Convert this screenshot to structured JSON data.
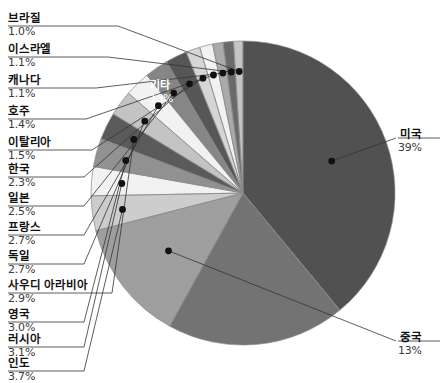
{
  "chart_data": {
    "type": "pie",
    "title": "",
    "legend": "callout-labels",
    "grid": false,
    "units": "percent",
    "total_label": "100%",
    "categories": [
      "미국",
      "기타",
      "중국",
      "인도",
      "러시아",
      "영국",
      "사우디 아라비아",
      "독일",
      "프랑스",
      "일본",
      "한국",
      "이탈리아",
      "호주",
      "캐나다",
      "이스라엘",
      "브라질"
    ],
    "values": [
      39,
      19,
      13,
      3.7,
      3.1,
      3.0,
      2.9,
      2.7,
      2.7,
      2.5,
      2.3,
      1.5,
      1.4,
      1.1,
      1.1,
      1.0
    ],
    "value_labels": [
      "39%",
      "19%",
      "13%",
      "3.7%",
      "3.1%",
      "3.0%",
      "2.9%",
      "2.7%",
      "2.7%",
      "2.5%",
      "2.3%",
      "1.5%",
      "1.4%",
      "1.1%",
      "1.1%",
      "1.0%"
    ],
    "slice_colors": [
      "#565656",
      "#7a7a7a",
      "#a8a8a8",
      "#d8d8d8",
      "#ffffff",
      "#9a9a9a",
      "#606060",
      "#cfcfcf",
      "#ffffff",
      "#8e8e8e",
      "#5c5c5c",
      "#e2e2e2",
      "#ffffff",
      "#b4b4b4",
      "#707070",
      "#d0d0d0"
    ],
    "slices": [
      {
        "name": "미국",
        "value": 39,
        "value_label": "39%",
        "color": "#565656",
        "label_position": "right-outside"
      },
      {
        "name": "기타",
        "value": 19,
        "value_label": "19%",
        "color": "#7a7a7a",
        "label_position": "inside"
      },
      {
        "name": "중국",
        "value": 13,
        "value_label": "13%",
        "color": "#a8a8a8",
        "label_position": "right-outside"
      },
      {
        "name": "인도",
        "value": 3.7,
        "value_label": "3.7%",
        "color": "#d8d8d8",
        "label_position": "left-outside"
      },
      {
        "name": "러시아",
        "value": 3.1,
        "value_label": "3.1%",
        "color": "#ffffff",
        "label_position": "left-outside"
      },
      {
        "name": "영국",
        "value": 3.0,
        "value_label": "3.0%",
        "color": "#9a9a9a",
        "label_position": "left-outside"
      },
      {
        "name": "사우디 아라비아",
        "value": 2.9,
        "value_label": "2.9%",
        "color": "#606060",
        "label_position": "left-outside"
      },
      {
        "name": "독일",
        "value": 2.7,
        "value_label": "2.7%",
        "color": "#cfcfcf",
        "label_position": "left-outside"
      },
      {
        "name": "프랑스",
        "value": 2.7,
        "value_label": "2.7%",
        "color": "#ffffff",
        "label_position": "left-outside"
      },
      {
        "name": "일본",
        "value": 2.5,
        "value_label": "2.5%",
        "color": "#8e8e8e",
        "label_position": "left-outside"
      },
      {
        "name": "한국",
        "value": 2.3,
        "value_label": "2.3%",
        "color": "#5c5c5c",
        "label_position": "left-outside"
      },
      {
        "name": "이탈리아",
        "value": 1.5,
        "value_label": "1.5%",
        "color": "#e2e2e2",
        "label_position": "left-outside"
      },
      {
        "name": "호주",
        "value": 1.4,
        "value_label": "1.4%",
        "color": "#ffffff",
        "label_position": "left-outside"
      },
      {
        "name": "캐나다",
        "value": 1.1,
        "value_label": "1.1%",
        "color": "#b4b4b4",
        "label_position": "left-outside"
      },
      {
        "name": "이스라엘",
        "value": 1.1,
        "value_label": "1.1%",
        "color": "#707070",
        "label_position": "left-outside"
      },
      {
        "name": "브라질",
        "value": 1.0,
        "value_label": "1.0%",
        "color": "#d0d0d0",
        "label_position": "left-outside"
      }
    ]
  },
  "labels": {
    "brazil": {
      "name": "브라질",
      "value": "1.0%"
    },
    "israel": {
      "name": "이스라엘",
      "value": "1.1%"
    },
    "canada": {
      "name": "캐나다",
      "value": "1.1%"
    },
    "australia": {
      "name": "호주",
      "value": "1.4%"
    },
    "italy": {
      "name": "이탈리아",
      "value": "1.5%"
    },
    "korea": {
      "name": "한국",
      "value": "2.3%"
    },
    "japan": {
      "name": "일본",
      "value": "2.5%"
    },
    "france": {
      "name": "프랑스",
      "value": "2.7%"
    },
    "germany": {
      "name": "독일",
      "value": "2.7%"
    },
    "saudi_arabia": {
      "name": "사우디 아라비아",
      "value": "2.9%"
    },
    "uk": {
      "name": "영국",
      "value": "3.0%"
    },
    "russia": {
      "name": "러시아",
      "value": "3.1%"
    },
    "india": {
      "name": "인도",
      "value": "3.7%"
    },
    "usa": {
      "name": "미국",
      "value": "39%"
    },
    "china": {
      "name": "중국",
      "value": "13%"
    },
    "others": {
      "name": "기타",
      "value": "19%"
    }
  },
  "colors": {
    "leader_line": "#333333",
    "dot": "#111111",
    "slice_outline": "#888888",
    "background": "#ffffff",
    "inner_label_text": "#ffffff"
  }
}
